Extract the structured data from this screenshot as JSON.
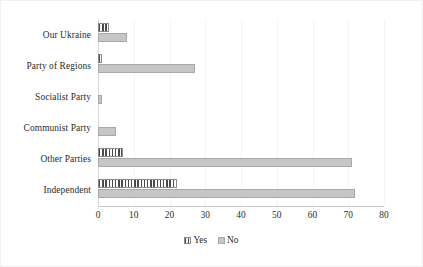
{
  "chart_data": {
    "type": "bar",
    "orientation": "horizontal",
    "title": "",
    "subtitle": "",
    "xlabel": "",
    "ylabel": "",
    "xlim": [
      0,
      80
    ],
    "xticks": [
      0,
      10,
      20,
      30,
      40,
      50,
      60,
      70,
      80
    ],
    "grid": true,
    "grid_axis": "x",
    "legend_position": "bottom-center",
    "categories": [
      "Our Ukraine",
      "Party of Regions",
      "Socialist Party",
      "Communist Party",
      "Other Parties",
      "Independent"
    ],
    "series": [
      {
        "name": "Yes",
        "pattern": "vertical-stripes",
        "color": "#4a4a4a",
        "values": [
          3,
          1,
          0,
          0,
          7,
          22
        ]
      },
      {
        "name": "No",
        "pattern": "solid",
        "color": "#c6c6c6",
        "values": [
          8,
          27,
          1,
          5,
          71,
          72
        ]
      }
    ]
  },
  "legend": {
    "items": [
      {
        "label": "Yes",
        "swatch": "striped-swatch-icon"
      },
      {
        "label": "No",
        "swatch": "solid-swatch-icon"
      }
    ]
  },
  "colors": {
    "yes_bar": "#4a4a4a",
    "no_bar": "#c6c6c6",
    "gridline": "#f4f4f4",
    "axis": "#c8c8c8",
    "text": "#2b2b2b",
    "border": "#f1f1f1",
    "background": "#ffffff"
  }
}
